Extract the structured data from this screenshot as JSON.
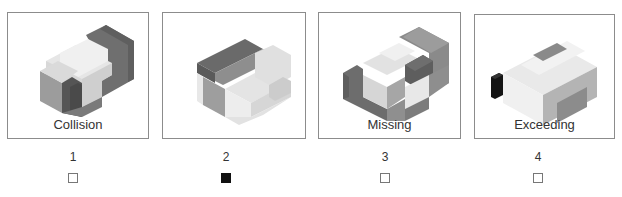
{
  "question": {
    "top_text_cut": "..."
  },
  "options": [
    {
      "number": "1",
      "caption": "Collision",
      "checked": false
    },
    {
      "number": "2",
      "caption": "",
      "checked": true
    },
    {
      "number": "3",
      "caption": "Missing",
      "checked": false
    },
    {
      "number": "4",
      "caption": "Exceeding",
      "checked": false
    }
  ],
  "colors": {
    "border": "#8c8c8c",
    "dark_gray": "#6e6e6e",
    "mid_gray": "#9a9a9a",
    "light_gray": "#d2d2d2",
    "very_light": "#ececec",
    "checked_fill": "#111111"
  }
}
